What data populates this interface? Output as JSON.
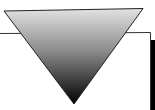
{
  "diagram": {
    "shapes": [
      {
        "type": "rectangle-frame",
        "name": "background-panel",
        "stroke": "#333333",
        "fill": "#ffffff",
        "shadow": "#000000"
      },
      {
        "type": "inverted-triangle",
        "name": "gradient-triangle",
        "gradient_top": "#e0e0e0",
        "gradient_bottom": "#000000",
        "stroke": "#222222"
      }
    ]
  }
}
